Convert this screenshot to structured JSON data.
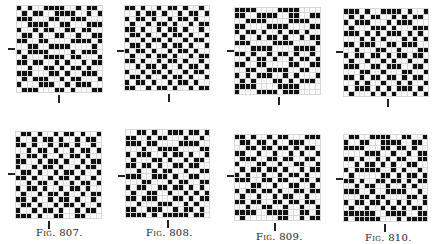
{
  "figures": [
    {
      "id": "fig-1",
      "caption": "",
      "grid": {
        "x": 16,
        "y": 5,
        "w": 87,
        "h": 88
      },
      "tick_left": {
        "x": 8,
        "y": 48
      },
      "tick_bottom": {
        "x": 58,
        "y": 95
      },
      "pattern": [
        "1010011110010110",
        "0101100111100101",
        "1110001100111000",
        "0011110011000111",
        "1001011001101100",
        "0110100110010011",
        "1100110000111101",
        "0011001111000010",
        "1011110000101110",
        "0100011110110001",
        "1101100101001011",
        "0010011010110100",
        "1110001101001110",
        "0101110010110001",
        "1000111001011100",
        "0111000110100011"
      ]
    },
    {
      "id": "fig-2",
      "caption": "",
      "grid": {
        "x": 124,
        "y": 5,
        "w": 86,
        "h": 86
      },
      "tick_left": {
        "x": 117,
        "y": 50
      },
      "tick_bottom": {
        "x": 168,
        "y": 94
      },
      "pattern": [
        "1101001011010010",
        "0010110100101101",
        "1011010010110100",
        "0100101101001011",
        "1101001011010010",
        "0110100101101001",
        "1001011010010110",
        "0110100101101001",
        "1011010010110100",
        "0100101101001011",
        "1101001011010010",
        "0010110100101101",
        "1001011010010110",
        "0110100101101001",
        "1011010010110100",
        "1100101101001011"
      ]
    },
    {
      "id": "fig-3",
      "caption": "",
      "grid": {
        "x": 234,
        "y": 7,
        "w": 87,
        "h": 88
      },
      "tick_left": {
        "x": 227,
        "y": 50
      },
      "tick_bottom": {
        "x": 278,
        "y": 97
      },
      "pattern": [
        "1111000011110000",
        "1100111100110011",
        "0011110000111100",
        "1100001111000011",
        "1011010010110100",
        "0100101101001011",
        "1110000111100001",
        "0001111000011110",
        "1101001011010010",
        "0010110100101101",
        "1100110000110011",
        "0011001111001100",
        "1010111001010001",
        "0101000110101110",
        "1111000011110000",
        "1000111101110000"
      ]
    },
    {
      "id": "fig-4",
      "caption": "",
      "grid": {
        "x": 343,
        "y": 8,
        "w": 86,
        "h": 89
      },
      "tick_left": {
        "x": 336,
        "y": 51
      },
      "tick_bottom": {
        "x": 387,
        "y": 99
      },
      "pattern": [
        "1110100111101001",
        "0101011001010110",
        "1011100010111000",
        "0100011101000111",
        "1110101011101010",
        "0001010100010101",
        "1101110011011100",
        "0010001100100011",
        "1011011010110110",
        "0100100101001001",
        "1110011011100110",
        "0001100100011001",
        "1101011011010110",
        "0010100100101001",
        "1011101010111010",
        "0100010101000101"
      ]
    },
    {
      "id": "fig-807",
      "caption": "Fig. 807.",
      "grid": {
        "x": 15,
        "y": 131,
        "w": 87,
        "h": 88
      },
      "tick_left": {
        "x": 8,
        "y": 173
      },
      "tick_bottom": {
        "x": 48,
        "y": 221
      },
      "caption_pos": {
        "x": 36,
        "y": 227
      },
      "pattern": [
        "0110100101101001",
        "1001011010010110",
        "1101001011010010",
        "0010110100101101",
        "1011010010110100",
        "1100101101001011",
        "1001011010010110",
        "0110100101101001",
        "1101001011010010",
        "0010110100101101",
        "1011010010110100",
        "0100101101001011",
        "1101001011010010",
        "0110100101101001",
        "1001011010010110",
        "1110100110011000"
      ]
    },
    {
      "id": "fig-808",
      "caption": "Fig. 808.",
      "grid": {
        "x": 125,
        "y": 129,
        "w": 85,
        "h": 89
      },
      "tick_left": {
        "x": 118,
        "y": 175
      },
      "tick_bottom": {
        "x": 167,
        "y": 220
      },
      "caption_pos": {
        "x": 146,
        "y": 227
      },
      "pattern": [
        "0011010011101101",
        "1100101100010010",
        "1110110000111100",
        "0001001111000011",
        "1011100101101001",
        "0100011010010110",
        "1101101001101100",
        "0010010110010011",
        "1110011101001100",
        "0001100010110011",
        "1011001101101010",
        "0100110010010101",
        "1101110001101011",
        "0010001110010100",
        "1100111001011010",
        "1111010111110110"
      ]
    },
    {
      "id": "fig-809",
      "caption": "Fig. 809.",
      "grid": {
        "x": 234,
        "y": 134,
        "w": 87,
        "h": 87
      },
      "tick_left": {
        "x": 227,
        "y": 175
      },
      "tick_bottom": {
        "x": 274,
        "y": 223
      },
      "caption_pos": {
        "x": 256,
        "y": 231
      },
      "pattern": [
        "1101001011000111",
        "0110110100111000",
        "0011011011010110",
        "1100100100101001",
        "0111001101100110",
        "1000110010011001",
        "0101101101001011",
        "1010010010110100",
        "1110011011001101",
        "0001100100110010",
        "1011011010011011",
        "0100100101100100",
        "1101100110110110",
        "0010011001001001",
        "1111001111001101",
        "0100000011001011"
      ]
    },
    {
      "id": "fig-810",
      "caption": "Fig. 810.",
      "grid": {
        "x": 343,
        "y": 134,
        "w": 85,
        "h": 88
      },
      "tick_left": {
        "x": 336,
        "y": 178
      },
      "tick_bottom": {
        "x": 384,
        "y": 224
      },
      "caption_pos": {
        "x": 365,
        "y": 232
      },
      "pattern": [
        "0110011110011001",
        "1001100111100110",
        "1111000110110100",
        "0000111001001011",
        "1101001010110011",
        "0010110101001100",
        "1011111001010010",
        "0100000110101101",
        "1101001101101011",
        "0010110010010100",
        "1110010011110010",
        "0001101100001101",
        "1011011010101001",
        "0100100101010110",
        "1111110011110011",
        "1011111000101111"
      ]
    }
  ]
}
